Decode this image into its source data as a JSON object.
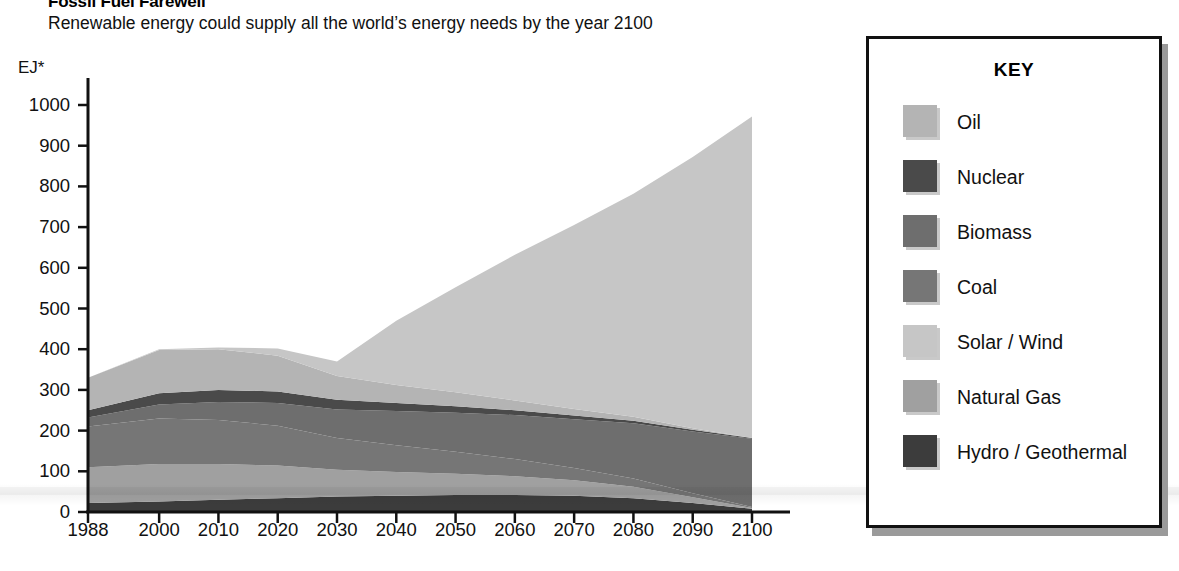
{
  "header": {
    "title": "Fossil Fuel Farewell",
    "subtitle": "Renewable energy could supply all the world’s energy needs by the year 2100"
  },
  "legend": {
    "heading": "KEY",
    "items": [
      {
        "label": "Oil",
        "color": "#b4b4b4"
      },
      {
        "label": "Nuclear",
        "color": "#4a4a4a"
      },
      {
        "label": "Biomass",
        "color": "#6e6e6e"
      },
      {
        "label": "Coal",
        "color": "#767676"
      },
      {
        "label": "Solar / Wind",
        "color": "#c6c6c6"
      },
      {
        "label": "Natural Gas",
        "color": "#a0a0a0"
      },
      {
        "label": "Hydro / Geothermal",
        "color": "#3c3c3c"
      }
    ]
  },
  "axes": {
    "y_unit": "EJ*",
    "y_ticks": [
      "1000",
      "900",
      "800",
      "700",
      "600",
      "500",
      "400",
      "300",
      "200",
      "100",
      "0"
    ],
    "x_ticks": [
      "1988",
      "2000",
      "2010",
      "2020",
      "2030",
      "2040",
      "2050",
      "2060",
      "2070",
      "2080",
      "2090",
      "2100"
    ]
  },
  "chart_data": {
    "type": "area",
    "title": "Fossil Fuel Farewell",
    "subtitle": "Renewable energy could supply all the world’s energy needs by the year 2100",
    "xlabel": "",
    "ylabel": "EJ*",
    "ylim": [
      0,
      1000
    ],
    "xlim": [
      1988,
      2100
    ],
    "grid": false,
    "stacked": true,
    "legend_position": "right",
    "x": [
      1988,
      2000,
      2010,
      2020,
      2030,
      2040,
      2050,
      2060,
      2070,
      2080,
      2090,
      2100
    ],
    "series": [
      {
        "name": "Hydro / Geothermal",
        "color": "#3c3c3c",
        "values": [
          22,
          26,
          30,
          34,
          38,
          40,
          42,
          42,
          40,
          34,
          22,
          8
        ]
      },
      {
        "name": "Natural Gas",
        "color": "#a0a0a0",
        "values": [
          88,
          92,
          88,
          80,
          66,
          58,
          52,
          46,
          38,
          28,
          14,
          2
        ]
      },
      {
        "name": "Coal",
        "color": "#767676",
        "values": [
          100,
          112,
          108,
          98,
          78,
          66,
          54,
          42,
          30,
          20,
          10,
          2
        ]
      },
      {
        "name": "Biomass",
        "color": "#6e6e6e",
        "values": [
          22,
          34,
          44,
          56,
          70,
          84,
          96,
          108,
          120,
          136,
          152,
          168
        ]
      },
      {
        "name": "Nuclear",
        "color": "#4a4a4a",
        "values": [
          18,
          28,
          30,
          28,
          24,
          20,
          16,
          12,
          9,
          6,
          4,
          2
        ]
      },
      {
        "name": "Oil",
        "color": "#b4b4b4",
        "values": [
          80,
          106,
          100,
          88,
          58,
          44,
          34,
          24,
          16,
          10,
          4,
          0
        ]
      },
      {
        "name": "Solar / Wind",
        "color": "#c6c6c6",
        "values": [
          0,
          2,
          4,
          18,
          36,
          158,
          258,
          358,
          452,
          548,
          666,
          790
        ]
      }
    ],
    "totals": [
      330,
      400,
      404,
      402,
      370,
      470,
      552,
      632,
      705,
      782,
      872,
      972
    ],
    "annotations": [
      {
        "text": "Apex of total supply reaches ~970 EJ at 2100",
        "x": 2100,
        "y": 972
      }
    ]
  }
}
